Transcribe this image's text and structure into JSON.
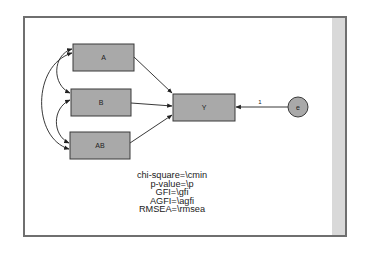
{
  "diagram": {
    "type": "path-diagram",
    "observed_variables": [
      {
        "id": "A",
        "label": "A"
      },
      {
        "id": "B",
        "label": "B"
      },
      {
        "id": "AB",
        "label": "AB"
      },
      {
        "id": "Y",
        "label": "Y"
      }
    ],
    "error_terms": [
      {
        "id": "e",
        "label": "e"
      }
    ],
    "paths": [
      {
        "from": "A",
        "to": "Y",
        "type": "regression"
      },
      {
        "from": "B",
        "to": "Y",
        "type": "regression"
      },
      {
        "from": "AB",
        "to": "Y",
        "type": "regression"
      },
      {
        "from": "e",
        "to": "Y",
        "type": "regression",
        "label": "1"
      }
    ],
    "covariances": [
      {
        "between": [
          "A",
          "B"
        ]
      },
      {
        "between": [
          "B",
          "AB"
        ]
      },
      {
        "between": [
          "A",
          "AB"
        ]
      }
    ],
    "error_path_label": "1"
  },
  "fit_stats": {
    "chi_square": "chi-square=\\cmin",
    "p_value": "p-value=\\p",
    "gfi": "GFI=\\gfi",
    "agfi": "AGFI=\\agfi",
    "rmsea": "RMSEA=\\rmsea"
  },
  "colors": {
    "box_fill": "#a9a9a9",
    "box_border": "#3a3a3a",
    "line": "#222222",
    "frame_border": "#6f6f6f",
    "scroll_strip": "#d9d9d9"
  }
}
